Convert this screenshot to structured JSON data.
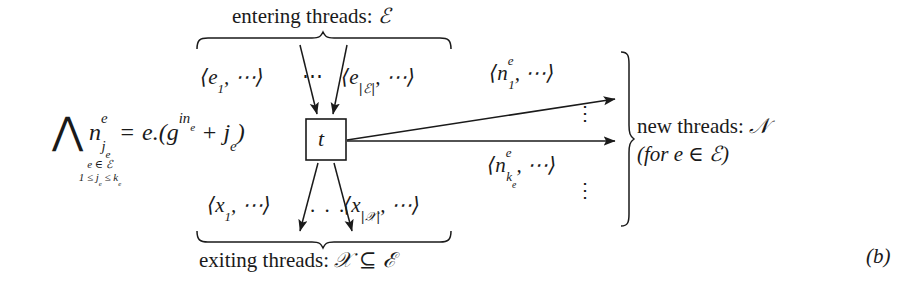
{
  "figure": {
    "panel_tag": "(b)",
    "node_label": "t",
    "width": 919,
    "height": 288,
    "background_color": "#ffffff",
    "ink_color": "#1a1a1a"
  },
  "equation": {
    "quantifier": "⋀",
    "condition_line1": "e ∈ ℰ",
    "condition_line2": "1 ≤ j",
    "condition_line2_sub1": "e",
    "condition_line2_mid": " ≤ k",
    "condition_line2_sub2": "e",
    "lhs_base": "n",
    "lhs_sup": "e",
    "lhs_sub": "j",
    "lhs_sub_sub": "e",
    "relation": "=",
    "rhs_prefix": "e.(g",
    "rhs_sup": "in",
    "rhs_sup_sub": "e",
    "rhs_plus": " + j",
    "rhs_sub": "e",
    "rhs_suffix": ")"
  },
  "entering": {
    "brace_label_text": "entering threads: ",
    "brace_label_symbol": "ℰ",
    "first_thread_open": "⟨e",
    "first_thread_sub": "1",
    "first_thread_close": ", ⋯⟩",
    "middle_dots": "⋯",
    "last_thread_open": "⟨e",
    "last_thread_sub": "|ℰ|",
    "last_thread_close": ", ⋯⟩"
  },
  "exiting": {
    "brace_label_text": "exiting threads: ",
    "brace_label_symbol": "𝒳 ⊆ ℰ",
    "first_thread_open": "⟨x",
    "first_thread_sub": "1",
    "first_thread_close": ", ⋯⟩",
    "middle_dots": ". . .",
    "last_thread_open": "⟨x",
    "last_thread_sub": "|𝒳|",
    "last_thread_close": ", ⋯⟩"
  },
  "new_threads": {
    "top_open": "⟨n",
    "top_sup": "e",
    "top_sub": "1",
    "top_close": ", ⋯⟩",
    "bottom_open": "⟨n",
    "bottom_sup": "e",
    "bottom_sub": "k",
    "bottom_sub_sub": "e",
    "bottom_close": ", ⋯⟩",
    "vertical_dots": "⋮",
    "brace_label_line1_text": "new threads: ",
    "brace_label_line1_symbol": "𝒩",
    "brace_label_line2": "(for e ∈ ℰ)"
  }
}
